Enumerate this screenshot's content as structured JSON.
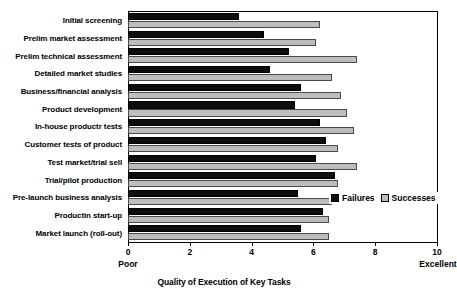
{
  "chart_data": {
    "type": "bar",
    "orientation": "horizontal",
    "title": "",
    "xlabel": "Quality of Execution of Key Tasks",
    "ylabel": "",
    "xlim": [
      0,
      10
    ],
    "grid": false,
    "legend_position": "inside-right",
    "x_ticks": [
      0,
      2,
      4,
      6,
      8,
      10
    ],
    "x_tick_labels": [
      "0",
      "2",
      "4",
      "6",
      "8",
      "10"
    ],
    "scale_anchor_low": "Poor",
    "scale_anchor_high": "Excellent",
    "categories": [
      "Initial screening",
      "Prelim market assessment",
      "Prelim technical assessment",
      "Detailed market studies",
      "Business/financial analysis",
      "Product development",
      "In-house productr tests",
      "Customer tests of product",
      "Test market/trial sell",
      "Trial/pilot production",
      "Pre-launch business analysis",
      "Productin start-up",
      "Market launch (roll-out)"
    ],
    "series": [
      {
        "name": "Failures",
        "color": "#0d0d0d",
        "values": [
          3.6,
          4.4,
          5.2,
          4.6,
          5.6,
          5.4,
          6.2,
          6.4,
          6.1,
          6.7,
          5.5,
          6.3,
          5.6
        ]
      },
      {
        "name": "Successes",
        "color": "#bdbdbd",
        "values": [
          6.2,
          6.1,
          7.4,
          6.6,
          6.9,
          7.1,
          7.3,
          6.8,
          7.4,
          6.8,
          6.6,
          6.5,
          6.5
        ]
      }
    ]
  },
  "legend": {
    "items": [
      {
        "label": "Failures",
        "color": "#0d0d0d"
      },
      {
        "label": "Successes",
        "color": "#bdbdbd"
      }
    ]
  }
}
